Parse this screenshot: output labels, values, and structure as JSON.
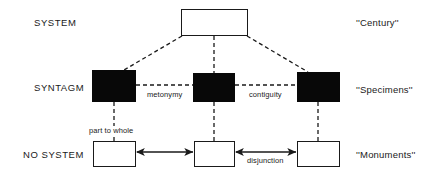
{
  "diagram": {
    "colors": {
      "ink": "#1a1a1a",
      "fill": "#080808",
      "background": "#ffffff"
    },
    "row_labels": [
      {
        "id": "system",
        "text": "SYSTEM"
      },
      {
        "id": "syntagm",
        "text": "SYNTAGM"
      },
      {
        "id": "no-system",
        "text": "NO SYSTEM"
      }
    ],
    "side_labels": [
      {
        "id": "century",
        "text": "''Century''"
      },
      {
        "id": "specimens",
        "text": "''Specimens''"
      },
      {
        "id": "monuments",
        "text": "''Monuments''"
      }
    ],
    "nodes": [
      {
        "id": "system-box",
        "style": "open",
        "row": "system"
      },
      {
        "id": "syntagm-left",
        "style": "filled",
        "row": "syntagm"
      },
      {
        "id": "syntagm-middle",
        "style": "filled",
        "row": "syntagm"
      },
      {
        "id": "syntagm-right",
        "style": "filled",
        "row": "syntagm"
      },
      {
        "id": "nosystem-left",
        "style": "open",
        "row": "no-system"
      },
      {
        "id": "nosystem-middle",
        "style": "open",
        "row": "no-system"
      },
      {
        "id": "nosystem-right",
        "style": "open",
        "row": "no-system"
      }
    ],
    "edge_labels": [
      {
        "id": "metonymy",
        "text": "metonymy"
      },
      {
        "id": "contiguity",
        "text": "contiguity"
      },
      {
        "id": "part-to-whole",
        "text": "part to whole"
      },
      {
        "id": "disjunction",
        "text": "disjunction"
      }
    ]
  }
}
